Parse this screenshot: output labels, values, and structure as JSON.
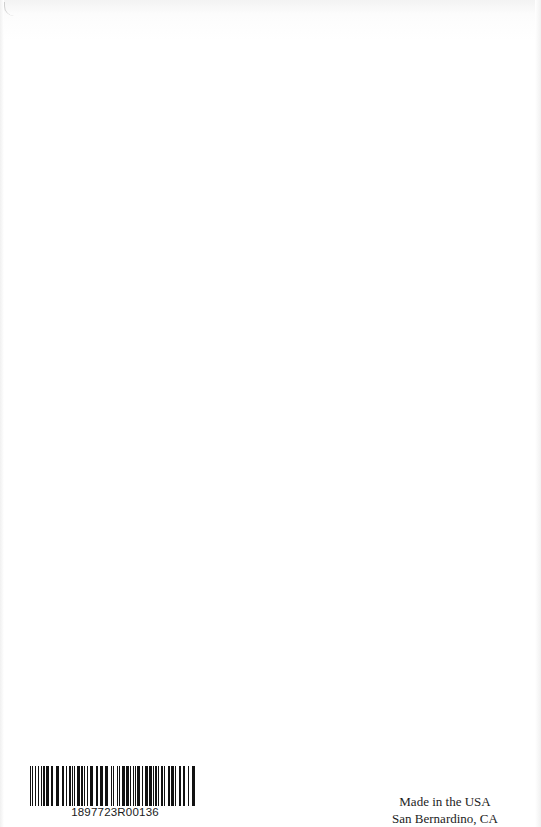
{
  "page": {
    "type": "book back page (print-on-demand colophon)",
    "background_color": "#ffffff"
  },
  "barcode": {
    "number": "1897723R00136",
    "bar_color": "#111111"
  },
  "imprint": {
    "line1": "Made in the USA",
    "line2": "San Bernardino, CA"
  }
}
